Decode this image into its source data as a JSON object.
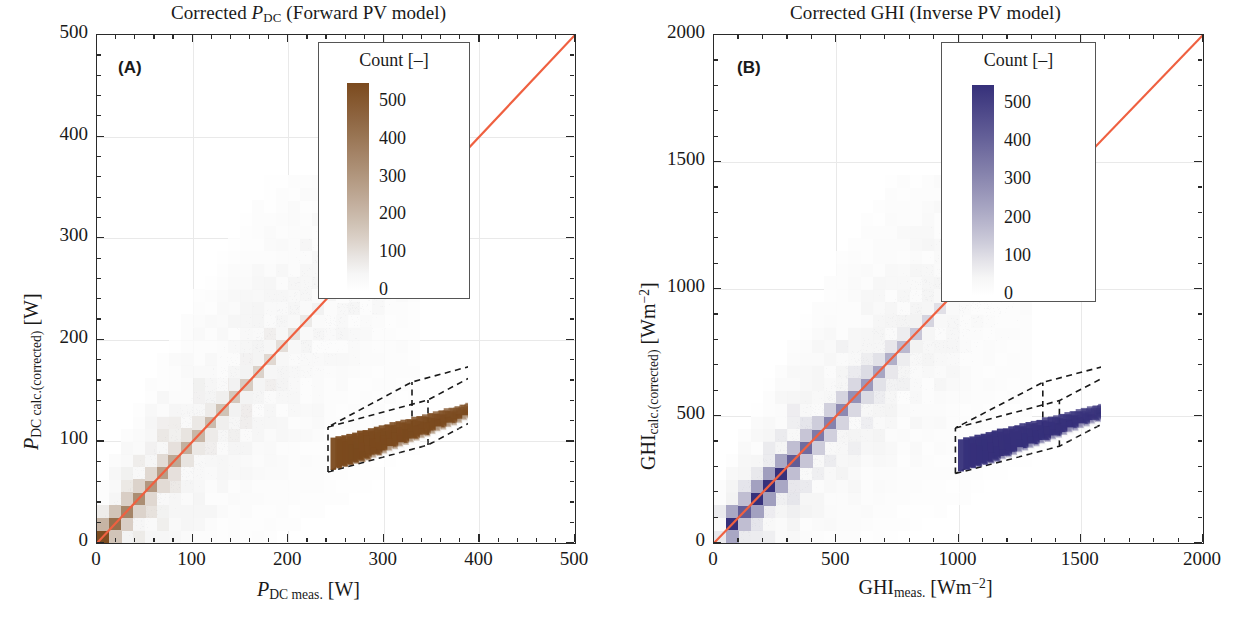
{
  "figure": {
    "panels": [
      {
        "tag": "(A)",
        "title_parts": {
          "pre": "Corrected ",
          "sym": "P",
          "sub": "DC",
          "post": " (Forward PV model)"
        },
        "title_plain": "Corrected P_DC (Forward PV model)",
        "xlabel_plain": "P_DC meas. [W]",
        "ylabel_plain": "P_DC calc.(corrected) [W]",
        "xlabel": {
          "sym": "P",
          "sub": "DC meas.",
          "unit": "[W]"
        },
        "ylabel": {
          "sym": "P",
          "sub": "DC calc.(corrected)",
          "unit": "[W]"
        },
        "legend": {
          "title": "Count [–]",
          "ticks": [
            "500",
            "400",
            "300",
            "200",
            "100",
            "0"
          ]
        },
        "accent": "#8a5a28",
        "line_color": "#ef6040"
      },
      {
        "tag": "(B)",
        "title_parts": {
          "pre": "Corrected ",
          "sym": "GHI",
          "sub": "",
          "post": " (Inverse PV model)"
        },
        "title_plain": "Corrected GHI (Inverse PV model)",
        "xlabel_plain": "GHI_meas. [W m^-2]",
        "ylabel_plain": "GHI_calc.(corrected) [W m^-2]",
        "xlabel": {
          "sym": "GHI",
          "sub": "meas.",
          "unit": "[Wm",
          "sup": "−2",
          "unit_end": "]"
        },
        "ylabel": {
          "sym": "GHI",
          "sub": "calc.(corrected)",
          "unit": "[Wm",
          "sup": "−2",
          "unit_end": "]"
        },
        "legend": {
          "title": "Count [–]",
          "ticks": [
            "500",
            "400",
            "300",
            "200",
            "100",
            "0"
          ]
        },
        "accent": "#4b4690",
        "line_color": "#ef6040"
      }
    ]
  },
  "chart_data": [
    {
      "type": "heatmap",
      "panel": "(A)",
      "title": "Corrected P_DC (Forward PV model)",
      "xlabel": "P_DC meas. [W]",
      "ylabel": "P_DC calc.(corrected) [W]",
      "xlim": [
        0,
        500
      ],
      "ylim": [
        0,
        500
      ],
      "xticks": [
        0,
        100,
        200,
        300,
        400,
        500
      ],
      "yticks": [
        0,
        100,
        200,
        300,
        400,
        500
      ],
      "minor_ticks_per_interval": 5,
      "grid": true,
      "colorbar": {
        "label": "Count [–]",
        "ticks": [
          0,
          100,
          200,
          300,
          400,
          500
        ],
        "range": [
          0,
          550
        ],
        "low_color": "#f2f2f2",
        "high_color": "#7b4a1e"
      },
      "identity_line": {
        "from": [
          0,
          0
        ],
        "to": [
          500,
          500
        ],
        "color": "#ef6040"
      },
      "bin_size": 12.5,
      "diagonal_counts": [
        {
          "x": 6,
          "y": 6,
          "count": 540
        },
        {
          "x": 19,
          "y": 19,
          "count": 430
        },
        {
          "x": 31,
          "y": 31,
          "count": 360
        },
        {
          "x": 44,
          "y": 44,
          "count": 330
        },
        {
          "x": 56,
          "y": 56,
          "count": 300
        },
        {
          "x": 69,
          "y": 69,
          "count": 280
        },
        {
          "x": 81,
          "y": 81,
          "count": 250
        },
        {
          "x": 94,
          "y": 94,
          "count": 230
        },
        {
          "x": 106,
          "y": 106,
          "count": 210
        },
        {
          "x": 119,
          "y": 119,
          "count": 195
        },
        {
          "x": 131,
          "y": 131,
          "count": 175
        },
        {
          "x": 144,
          "y": 144,
          "count": 160
        },
        {
          "x": 156,
          "y": 156,
          "count": 150
        },
        {
          "x": 169,
          "y": 169,
          "count": 135
        },
        {
          "x": 181,
          "y": 181,
          "count": 120
        },
        {
          "x": 194,
          "y": 194,
          "count": 105
        },
        {
          "x": 206,
          "y": 206,
          "count": 95
        },
        {
          "x": 219,
          "y": 219,
          "count": 80
        },
        {
          "x": 231,
          "y": 231,
          "count": 65
        },
        {
          "x": 244,
          "y": 244,
          "count": 50
        },
        {
          "x": 256,
          "y": 256,
          "count": 38
        },
        {
          "x": 269,
          "y": 269,
          "count": 28
        },
        {
          "x": 281,
          "y": 281,
          "count": 18
        },
        {
          "x": 294,
          "y": 294,
          "count": 10
        }
      ],
      "scatter_extent": {
        "x": [
          0,
          320
        ],
        "y": [
          0,
          300
        ]
      },
      "inset": {
        "type": "3d-histogram",
        "box": "dashed",
        "bar_color": "#7b4a1e"
      }
    },
    {
      "type": "heatmap",
      "panel": "(B)",
      "title": "Corrected GHI (Inverse PV model)",
      "xlabel": "GHI_meas. [W m^-2]",
      "ylabel": "GHI_calc.(corrected) [W m^-2]",
      "xlim": [
        0,
        2000
      ],
      "ylim": [
        0,
        2000
      ],
      "xticks": [
        0,
        500,
        1000,
        1500,
        2000
      ],
      "yticks": [
        0,
        500,
        1000,
        1500,
        2000
      ],
      "minor_ticks_per_interval": 5,
      "grid": true,
      "colorbar": {
        "label": "Count [–]",
        "ticks": [
          0,
          100,
          200,
          300,
          400,
          500
        ],
        "range": [
          0,
          550
        ],
        "low_color": "#f2f2f2",
        "high_color": "#36307a"
      },
      "identity_line": {
        "from": [
          0,
          0
        ],
        "to": [
          2000,
          2000
        ],
        "color": "#ef6040"
      },
      "bin_size": 50,
      "diagonal_counts": [
        {
          "x": 25,
          "y": 25,
          "count": 80
        },
        {
          "x": 75,
          "y": 75,
          "count": 560
        },
        {
          "x": 125,
          "y": 125,
          "count": 420
        },
        {
          "x": 175,
          "y": 175,
          "count": 600
        },
        {
          "x": 225,
          "y": 225,
          "count": 620
        },
        {
          "x": 275,
          "y": 275,
          "count": 560
        },
        {
          "x": 325,
          "y": 325,
          "count": 420
        },
        {
          "x": 375,
          "y": 375,
          "count": 380
        },
        {
          "x": 425,
          "y": 425,
          "count": 340
        },
        {
          "x": 475,
          "y": 475,
          "count": 320
        },
        {
          "x": 525,
          "y": 525,
          "count": 300
        },
        {
          "x": 575,
          "y": 575,
          "count": 280
        },
        {
          "x": 625,
          "y": 625,
          "count": 260
        },
        {
          "x": 675,
          "y": 675,
          "count": 230
        },
        {
          "x": 725,
          "y": 725,
          "count": 205
        },
        {
          "x": 775,
          "y": 775,
          "count": 180
        },
        {
          "x": 825,
          "y": 825,
          "count": 150
        },
        {
          "x": 875,
          "y": 875,
          "count": 120
        },
        {
          "x": 925,
          "y": 925,
          "count": 95
        },
        {
          "x": 975,
          "y": 975,
          "count": 70
        },
        {
          "x": 1025,
          "y": 1025,
          "count": 50
        },
        {
          "x": 1075,
          "y": 1075,
          "count": 32
        },
        {
          "x": 1125,
          "y": 1125,
          "count": 20
        },
        {
          "x": 1175,
          "y": 1175,
          "count": 12
        }
      ],
      "scatter_extent": {
        "x": [
          0,
          1250
        ],
        "y": [
          0,
          1250
        ]
      },
      "inset": {
        "type": "3d-histogram",
        "box": "dashed",
        "bar_color": "#36307a"
      }
    }
  ]
}
